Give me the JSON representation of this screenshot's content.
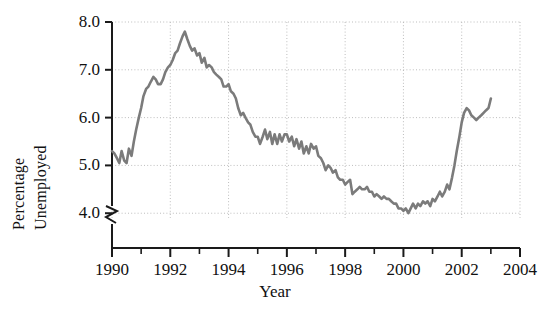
{
  "chart_data": {
    "type": "line",
    "title": "",
    "xlabel": "Year",
    "ylabel": "Percentage Unemployed",
    "ylabel_lines": [
      "Percentage",
      "Unemployed"
    ],
    "xlim": [
      1990,
      2004
    ],
    "ylim": [
      3.55,
      8.0
    ],
    "y_axis_break": true,
    "grid": true,
    "grid_style": "dotted",
    "legend": "none",
    "yticks": [
      4.0,
      5.0,
      6.0,
      7.0,
      8.0
    ],
    "ytick_labels": [
      "4.0",
      "5.0",
      "6.0",
      "7.0",
      "8.0"
    ],
    "xticks": [
      1990,
      1992,
      1994,
      1996,
      1998,
      2000,
      2002,
      2004
    ],
    "xtick_labels": [
      "1990",
      "1992",
      "1994",
      "1996",
      "1998",
      "2000",
      "2002",
      "2004"
    ],
    "xminor_ticks": [
      1991,
      1993,
      1995,
      1997,
      1999,
      2001,
      2003
    ],
    "line_color": "#7b7b7b",
    "line_width": 2.6,
    "series_name": "Percentage Unemployed",
    "x": [
      1990.0,
      1990.08,
      1990.17,
      1990.25,
      1990.33,
      1990.42,
      1990.5,
      1990.58,
      1990.67,
      1990.75,
      1990.83,
      1990.92,
      1991.0,
      1991.08,
      1991.17,
      1991.25,
      1991.33,
      1991.42,
      1991.5,
      1991.58,
      1991.67,
      1991.75,
      1991.83,
      1991.92,
      1992.0,
      1992.08,
      1992.17,
      1992.25,
      1992.33,
      1992.42,
      1992.5,
      1992.58,
      1992.67,
      1992.75,
      1992.83,
      1992.92,
      1993.0,
      1993.08,
      1993.17,
      1993.25,
      1993.33,
      1993.42,
      1993.5,
      1993.58,
      1993.67,
      1993.75,
      1993.83,
      1993.92,
      1994.0,
      1994.08,
      1994.17,
      1994.25,
      1994.33,
      1994.42,
      1994.5,
      1994.58,
      1994.67,
      1994.75,
      1994.83,
      1994.92,
      1995.0,
      1995.08,
      1995.17,
      1995.25,
      1995.33,
      1995.42,
      1995.5,
      1995.58,
      1995.67,
      1995.75,
      1995.83,
      1995.92,
      1996.0,
      1996.08,
      1996.17,
      1996.25,
      1996.33,
      1996.42,
      1996.5,
      1996.58,
      1996.67,
      1996.75,
      1996.83,
      1996.92,
      1997.0,
      1997.08,
      1997.17,
      1997.25,
      1997.33,
      1997.42,
      1997.5,
      1997.58,
      1997.67,
      1997.75,
      1997.83,
      1997.92,
      1998.0,
      1998.08,
      1998.17,
      1998.25,
      1998.33,
      1998.42,
      1998.5,
      1998.58,
      1998.67,
      1998.75,
      1998.83,
      1998.92,
      1999.0,
      1999.08,
      1999.17,
      1999.25,
      1999.33,
      1999.42,
      1999.5,
      1999.58,
      1999.67,
      1999.75,
      1999.83,
      1999.92,
      2000.0,
      2000.08,
      2000.17,
      2000.25,
      2000.33,
      2000.42,
      2000.5,
      2000.58,
      2000.67,
      2000.75,
      2000.83,
      2000.92,
      2001.0,
      2001.08,
      2001.17,
      2001.25,
      2001.33,
      2001.42,
      2001.5,
      2001.58,
      2001.67,
      2001.75,
      2001.83,
      2001.92,
      2002.0,
      2002.08,
      2002.17,
      2002.25,
      2002.33,
      2002.42,
      2002.5,
      2002.58,
      2002.67,
      2002.75,
      2002.83,
      2002.92,
      2003.0
    ],
    "values": [
      5.3,
      5.25,
      5.15,
      5.05,
      5.3,
      5.1,
      5.05,
      5.35,
      5.2,
      5.5,
      5.75,
      6.0,
      6.2,
      6.45,
      6.6,
      6.65,
      6.75,
      6.85,
      6.8,
      6.7,
      6.7,
      6.8,
      6.95,
      7.05,
      7.1,
      7.2,
      7.35,
      7.4,
      7.55,
      7.7,
      7.8,
      7.65,
      7.5,
      7.4,
      7.45,
      7.3,
      7.35,
      7.15,
      7.25,
      7.05,
      7.1,
      7.05,
      6.95,
      6.9,
      6.85,
      6.8,
      6.65,
      6.65,
      6.7,
      6.55,
      6.5,
      6.4,
      6.2,
      6.05,
      6.1,
      6.0,
      5.9,
      5.85,
      5.7,
      5.6,
      5.6,
      5.45,
      5.6,
      5.75,
      5.55,
      5.7,
      5.45,
      5.65,
      5.45,
      5.65,
      5.5,
      5.65,
      5.65,
      5.5,
      5.6,
      5.4,
      5.55,
      5.35,
      5.5,
      5.25,
      5.4,
      5.25,
      5.45,
      5.35,
      5.4,
      5.2,
      5.15,
      5.05,
      4.9,
      5.0,
      4.95,
      4.85,
      4.9,
      4.75,
      4.7,
      4.7,
      4.6,
      4.65,
      4.7,
      4.4,
      4.45,
      4.5,
      4.55,
      4.5,
      4.5,
      4.55,
      4.45,
      4.45,
      4.35,
      4.4,
      4.35,
      4.3,
      4.35,
      4.3,
      4.3,
      4.25,
      4.2,
      4.2,
      4.1,
      4.1,
      4.05,
      4.1,
      4.0,
      4.1,
      4.2,
      4.1,
      4.2,
      4.15,
      4.25,
      4.2,
      4.25,
      4.15,
      4.3,
      4.25,
      4.35,
      4.45,
      4.35,
      4.45,
      4.6,
      4.5,
      4.75,
      5.0,
      5.3,
      5.6,
      5.9,
      6.1,
      6.2,
      6.15,
      6.05,
      6.0,
      5.95,
      6.0,
      6.05,
      6.1,
      6.15,
      6.2,
      6.4
    ]
  }
}
